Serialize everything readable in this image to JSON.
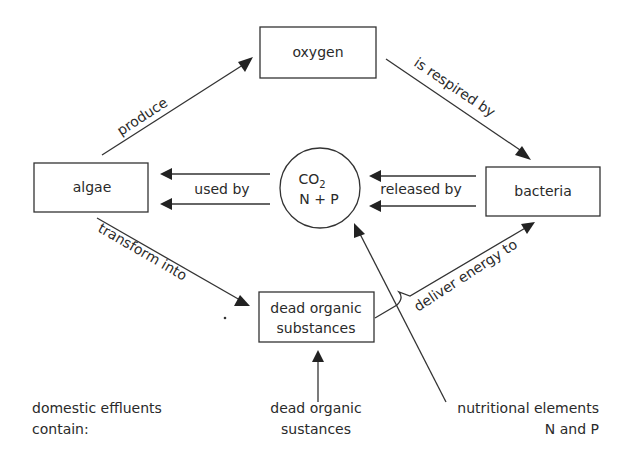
{
  "diagram": {
    "nodes": {
      "oxygen": "oxygen",
      "algae": "algae",
      "bacteria": "bacteria",
      "center_line1": "CO",
      "center_sub": "2",
      "center_line2": "N + P",
      "dead_line1": "dead organic",
      "dead_line2": "substances"
    },
    "edges": {
      "produce": "produce",
      "respired": "is respired by",
      "used_by": "used by",
      "released_by": "released by",
      "transform": "transform into",
      "deliver": "deliver energy to"
    },
    "inputs": {
      "header_line1": "domestic effluents",
      "header_line2": "contain:",
      "dead_line1": "dead organic",
      "dead_line2": "sustances",
      "nutr_line1": "nutritional elements",
      "nutr_line2": "N and  P"
    }
  }
}
